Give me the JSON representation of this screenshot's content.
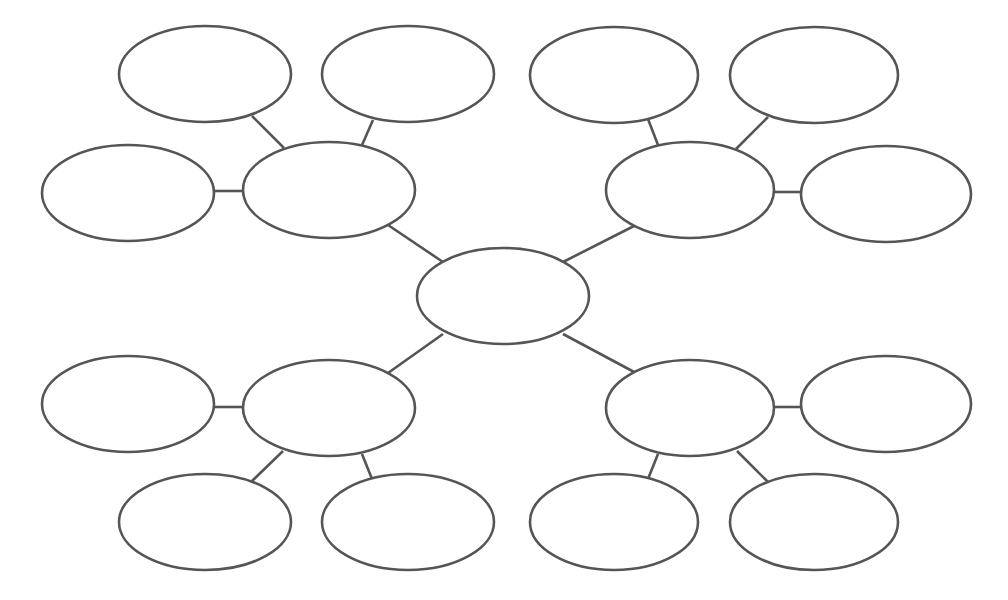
{
  "diagram": {
    "type": "mind-map",
    "title": "",
    "stroke_color": "#555555",
    "fill_color": "#ffffff",
    "background": "#ffffff",
    "nodes": [
      {
        "id": "center",
        "label": "",
        "cx": 503,
        "cy": 296,
        "rx": 86,
        "ry": 48
      },
      {
        "id": "hub-tl",
        "label": "",
        "cx": 329,
        "cy": 190,
        "rx": 86,
        "ry": 48
      },
      {
        "id": "hub-tr",
        "label": "",
        "cx": 690,
        "cy": 190,
        "rx": 84,
        "ry": 48
      },
      {
        "id": "hub-bl",
        "label": "",
        "cx": 329,
        "cy": 408,
        "rx": 86,
        "ry": 48
      },
      {
        "id": "hub-br",
        "label": "",
        "cx": 690,
        "cy": 408,
        "rx": 84,
        "ry": 48
      },
      {
        "id": "tl-a",
        "label": "",
        "cx": 205,
        "cy": 74,
        "rx": 86,
        "ry": 48
      },
      {
        "id": "tl-b",
        "label": "",
        "cx": 408,
        "cy": 74,
        "rx": 86,
        "ry": 48
      },
      {
        "id": "tl-c",
        "label": "",
        "cx": 128,
        "cy": 193,
        "rx": 86,
        "ry": 48
      },
      {
        "id": "tr-a",
        "label": "",
        "cx": 614,
        "cy": 75,
        "rx": 84,
        "ry": 48
      },
      {
        "id": "tr-b",
        "label": "",
        "cx": 814,
        "cy": 75,
        "rx": 84,
        "ry": 48
      },
      {
        "id": "tr-c",
        "label": "",
        "cx": 886,
        "cy": 194,
        "rx": 85,
        "ry": 48
      },
      {
        "id": "bl-a",
        "label": "",
        "cx": 128,
        "cy": 404,
        "rx": 86,
        "ry": 48
      },
      {
        "id": "bl-b",
        "label": "",
        "cx": 205,
        "cy": 522,
        "rx": 86,
        "ry": 48
      },
      {
        "id": "bl-c",
        "label": "",
        "cx": 408,
        "cy": 522,
        "rx": 86,
        "ry": 48
      },
      {
        "id": "br-a",
        "label": "",
        "cx": 886,
        "cy": 404,
        "rx": 85,
        "ry": 48
      },
      {
        "id": "br-b",
        "label": "",
        "cx": 614,
        "cy": 522,
        "rx": 84,
        "ry": 48
      },
      {
        "id": "br-c",
        "label": "",
        "cx": 814,
        "cy": 522,
        "rx": 84,
        "ry": 48
      }
    ],
    "edges": [
      {
        "from": "center",
        "to": "hub-tl",
        "x1": 443,
        "y1": 262,
        "x2": 388,
        "y2": 225
      },
      {
        "from": "center",
        "to": "hub-tr",
        "x1": 563,
        "y1": 262,
        "x2": 636,
        "y2": 225
      },
      {
        "from": "center",
        "to": "hub-bl",
        "x1": 443,
        "y1": 334,
        "x2": 388,
        "y2": 373
      },
      {
        "from": "center",
        "to": "hub-br",
        "x1": 563,
        "y1": 334,
        "x2": 636,
        "y2": 373
      },
      {
        "from": "hub-tl",
        "to": "tl-a",
        "x1": 284,
        "y1": 148,
        "x2": 252,
        "y2": 116
      },
      {
        "from": "hub-tl",
        "to": "tl-b",
        "x1": 362,
        "y1": 145,
        "x2": 373,
        "y2": 120
      },
      {
        "from": "hub-tl",
        "to": "tl-c",
        "x1": 243,
        "y1": 191,
        "x2": 214,
        "y2": 191
      },
      {
        "from": "hub-tr",
        "to": "tr-a",
        "x1": 658,
        "y1": 145,
        "x2": 648,
        "y2": 119
      },
      {
        "from": "hub-tr",
        "to": "tr-b",
        "x1": 736,
        "y1": 149,
        "x2": 768,
        "y2": 117
      },
      {
        "from": "hub-tr",
        "to": "tr-c",
        "x1": 774,
        "y1": 192,
        "x2": 802,
        "y2": 192
      },
      {
        "from": "hub-bl",
        "to": "bl-a",
        "x1": 243,
        "y1": 407,
        "x2": 214,
        "y2": 407
      },
      {
        "from": "hub-bl",
        "to": "bl-b",
        "x1": 283,
        "y1": 451,
        "x2": 251,
        "y2": 482
      },
      {
        "from": "hub-bl",
        "to": "bl-c",
        "x1": 362,
        "y1": 454,
        "x2": 372,
        "y2": 479
      },
      {
        "from": "hub-br",
        "to": "br-a",
        "x1": 774,
        "y1": 407,
        "x2": 802,
        "y2": 407
      },
      {
        "from": "hub-br",
        "to": "br-b",
        "x1": 658,
        "y1": 454,
        "x2": 648,
        "y2": 479
      },
      {
        "from": "hub-br",
        "to": "br-c",
        "x1": 737,
        "y1": 451,
        "x2": 768,
        "y2": 482
      }
    ]
  }
}
